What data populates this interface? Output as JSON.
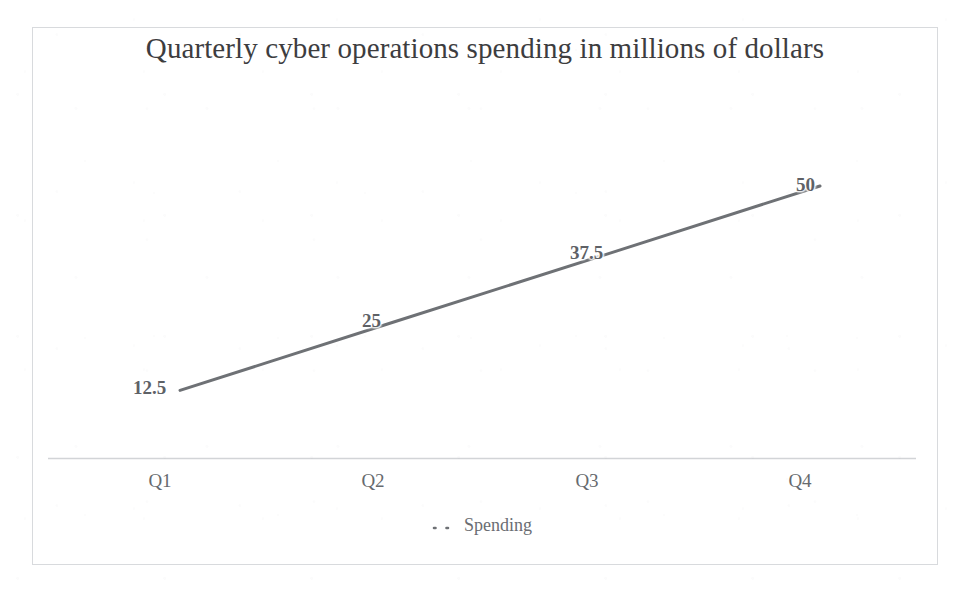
{
  "chart_data": {
    "type": "line",
    "title": "Quarterly cyber operations spending in millions of dollars",
    "xlabel": "",
    "ylabel": "",
    "categories": [
      "Q1",
      "Q2",
      "Q3",
      "Q4"
    ],
    "series": [
      {
        "name": "Spending",
        "values": [
          12.5,
          25,
          37.5,
          50
        ],
        "value_labels": [
          "12.5",
          "25",
          "37.5",
          "50"
        ],
        "color": "#6e7175",
        "line_width": 3,
        "markers": false,
        "data_labels": true
      }
    ],
    "ylim": [
      0,
      55
    ],
    "grid": false,
    "y_axis_visible": false,
    "x_axis_line": true,
    "x_axis_color": "#d2d4d7",
    "legend": {
      "visible": true,
      "position": "bottom",
      "entries": [
        {
          "label": "Spending",
          "marker": "dotted-line-marker",
          "color": "#6e7175"
        }
      ]
    },
    "plot_border": true,
    "plot_border_color": "#b2b6bc",
    "background": "#ffffff",
    "title_color": "#3d3d3f",
    "tick_label_color": "#666a6e",
    "data_label_color": "#5e6166"
  },
  "chart": {
    "title": "Quarterly cyber operations spending in millions of dollars",
    "legend_label": "Spending",
    "categories": [
      {
        "label": "Q1"
      },
      {
        "label": "Q2"
      },
      {
        "label": "Q3"
      },
      {
        "label": "Q4"
      }
    ],
    "point_labels": [
      {
        "text": "12.5"
      },
      {
        "text": "25"
      },
      {
        "text": "37.5"
      },
      {
        "text": "50"
      }
    ]
  }
}
